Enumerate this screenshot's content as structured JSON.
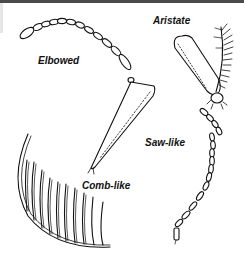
{
  "figure": {
    "labels": {
      "elbowed": "Elbowed",
      "aristate": "Aristate",
      "saw_like": "Saw-like",
      "comb_like": "Comb-like"
    }
  }
}
